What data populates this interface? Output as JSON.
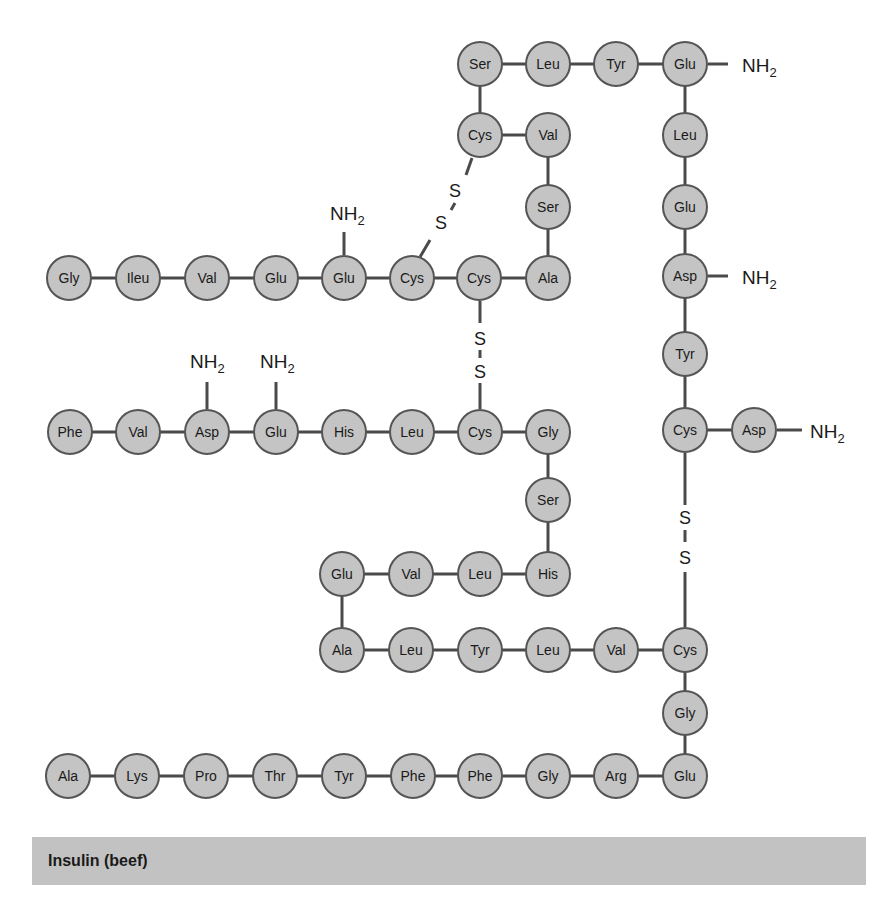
{
  "diagram": {
    "title": "Insulin (beef)",
    "style": {
      "circle_fill": "#c4c4c4",
      "circle_stroke": "#555555",
      "bond_color": "#4a4a4a",
      "text_color": "#1a1a1a",
      "caption_bg": "#c2c2c2"
    },
    "residues": [
      {
        "id": "b1",
        "label": "Ser",
        "x": 480,
        "y": 64
      },
      {
        "id": "b2",
        "label": "Leu",
        "x": 548,
        "y": 64
      },
      {
        "id": "b3",
        "label": "Tyr",
        "x": 616,
        "y": 64
      },
      {
        "id": "b4",
        "label": "Glu",
        "x": 685,
        "y": 64
      },
      {
        "id": "b5",
        "label": "Cys",
        "x": 480,
        "y": 135
      },
      {
        "id": "b6",
        "label": "Val",
        "x": 548,
        "y": 135
      },
      {
        "id": "b7",
        "label": "Leu",
        "x": 685,
        "y": 135
      },
      {
        "id": "b8",
        "label": "Ser",
        "x": 548,
        "y": 207
      },
      {
        "id": "b9",
        "label": "Glu",
        "x": 685,
        "y": 207
      },
      {
        "id": "a1",
        "label": "Gly",
        "x": 69,
        "y": 278
      },
      {
        "id": "a2",
        "label": "Ileu",
        "x": 138,
        "y": 278
      },
      {
        "id": "a3",
        "label": "Val",
        "x": 207,
        "y": 278
      },
      {
        "id": "a4",
        "label": "Glu",
        "x": 276,
        "y": 278
      },
      {
        "id": "a5",
        "label": "Glu",
        "x": 344,
        "y": 278
      },
      {
        "id": "a6",
        "label": "Cys",
        "x": 412,
        "y": 278
      },
      {
        "id": "a7",
        "label": "Cys",
        "x": 479,
        "y": 278
      },
      {
        "id": "a8",
        "label": "Ala",
        "x": 548,
        "y": 278
      },
      {
        "id": "b10",
        "label": "Asp",
        "x": 685,
        "y": 276
      },
      {
        "id": "b11",
        "label": "Tyr",
        "x": 685,
        "y": 354
      },
      {
        "id": "c1",
        "label": "Phe",
        "x": 70,
        "y": 432
      },
      {
        "id": "c2",
        "label": "Val",
        "x": 138,
        "y": 432
      },
      {
        "id": "c3",
        "label": "Asp",
        "x": 207,
        "y": 432
      },
      {
        "id": "c4",
        "label": "Glu",
        "x": 276,
        "y": 432
      },
      {
        "id": "c5",
        "label": "His",
        "x": 344,
        "y": 432
      },
      {
        "id": "c6",
        "label": "Leu",
        "x": 412,
        "y": 432
      },
      {
        "id": "c7",
        "label": "Cys",
        "x": 480,
        "y": 432
      },
      {
        "id": "c8",
        "label": "Gly",
        "x": 548,
        "y": 432
      },
      {
        "id": "b12",
        "label": "Cys",
        "x": 685,
        "y": 430
      },
      {
        "id": "b13",
        "label": "Asp",
        "x": 754,
        "y": 430
      },
      {
        "id": "c9",
        "label": "Ser",
        "x": 548,
        "y": 500
      },
      {
        "id": "c10",
        "label": "His",
        "x": 548,
        "y": 574
      },
      {
        "id": "c11",
        "label": "Leu",
        "x": 480,
        "y": 574
      },
      {
        "id": "c12",
        "label": "Val",
        "x": 411,
        "y": 574
      },
      {
        "id": "c13",
        "label": "Glu",
        "x": 342,
        "y": 574
      },
      {
        "id": "c14",
        "label": "Ala",
        "x": 342,
        "y": 650
      },
      {
        "id": "c15",
        "label": "Leu",
        "x": 411,
        "y": 650
      },
      {
        "id": "c16",
        "label": "Tyr",
        "x": 480,
        "y": 650
      },
      {
        "id": "c17",
        "label": "Leu",
        "x": 548,
        "y": 650
      },
      {
        "id": "c18",
        "label": "Val",
        "x": 616,
        "y": 650
      },
      {
        "id": "c19",
        "label": "Cys",
        "x": 685,
        "y": 650
      },
      {
        "id": "c20",
        "label": "Gly",
        "x": 685,
        "y": 713
      },
      {
        "id": "c30",
        "label": "Ala",
        "x": 68,
        "y": 776
      },
      {
        "id": "c29",
        "label": "Lys",
        "x": 137,
        "y": 776
      },
      {
        "id": "c28",
        "label": "Pro",
        "x": 206,
        "y": 776
      },
      {
        "id": "c27",
        "label": "Thr",
        "x": 275,
        "y": 776
      },
      {
        "id": "c26",
        "label": "Tyr",
        "x": 344,
        "y": 776
      },
      {
        "id": "c25",
        "label": "Phe",
        "x": 413,
        "y": 776
      },
      {
        "id": "c24",
        "label": "Phe",
        "x": 480,
        "y": 776
      },
      {
        "id": "c23",
        "label": "Gly",
        "x": 548,
        "y": 776
      },
      {
        "id": "c22",
        "label": "Arg",
        "x": 616,
        "y": 776
      },
      {
        "id": "c21",
        "label": "Glu",
        "x": 685,
        "y": 776
      }
    ],
    "bonds": [
      [
        "b1",
        "b2"
      ],
      [
        "b2",
        "b3"
      ],
      [
        "b3",
        "b4"
      ],
      [
        "b1",
        "b5"
      ],
      [
        "b5",
        "b6"
      ],
      [
        "b6",
        "b8"
      ],
      [
        "b8",
        "a8"
      ],
      [
        "b4",
        "b7"
      ],
      [
        "b7",
        "b9"
      ],
      [
        "b9",
        "b10"
      ],
      [
        "b10",
        "b11"
      ],
      [
        "b11",
        "b12"
      ],
      [
        "b12",
        "b13"
      ],
      [
        "a1",
        "a2"
      ],
      [
        "a2",
        "a3"
      ],
      [
        "a3",
        "a4"
      ],
      [
        "a4",
        "a5"
      ],
      [
        "a5",
        "a6"
      ],
      [
        "a6",
        "a7"
      ],
      [
        "a7",
        "a8"
      ],
      [
        "c1",
        "c2"
      ],
      [
        "c2",
        "c3"
      ],
      [
        "c3",
        "c4"
      ],
      [
        "c4",
        "c5"
      ],
      [
        "c5",
        "c6"
      ],
      [
        "c6",
        "c7"
      ],
      [
        "c7",
        "c8"
      ],
      [
        "c8",
        "c9"
      ],
      [
        "c9",
        "c10"
      ],
      [
        "c10",
        "c11"
      ],
      [
        "c11",
        "c12"
      ],
      [
        "c12",
        "c13"
      ],
      [
        "c13",
        "c14"
      ],
      [
        "c14",
        "c15"
      ],
      [
        "c15",
        "c16"
      ],
      [
        "c16",
        "c17"
      ],
      [
        "c17",
        "c18"
      ],
      [
        "c18",
        "c19"
      ],
      [
        "c19",
        "c20"
      ],
      [
        "c20",
        "c21"
      ],
      [
        "c21",
        "c22"
      ],
      [
        "c22",
        "c23"
      ],
      [
        "c23",
        "c24"
      ],
      [
        "c24",
        "c25"
      ],
      [
        "c25",
        "c26"
      ],
      [
        "c26",
        "c27"
      ],
      [
        "c27",
        "c28"
      ],
      [
        "c28",
        "c29"
      ],
      [
        "c29",
        "c30"
      ]
    ],
    "amide_groups": [
      {
        "label": "NH",
        "sub": "2",
        "line": [
          708,
          64,
          728,
          64
        ],
        "x": 742,
        "y": 72
      },
      {
        "label": "NH",
        "sub": "2",
        "line": [
          344,
          255,
          344,
          232
        ],
        "x": 330,
        "y": 220
      },
      {
        "label": "NH",
        "sub": "2",
        "line": [
          708,
          276,
          728,
          276
        ],
        "x": 742,
        "y": 284
      },
      {
        "label": "NH",
        "sub": "2",
        "line": [
          207,
          409,
          207,
          382
        ],
        "x": 190,
        "y": 368
      },
      {
        "label": "NH",
        "sub": "2",
        "line": [
          276,
          409,
          276,
          382
        ],
        "x": 260,
        "y": 368
      },
      {
        "label": "NH",
        "sub": "2",
        "line": [
          777,
          430,
          802,
          430
        ],
        "x": 810,
        "y": 438
      }
    ],
    "disulfide_bridges": [
      {
        "segments": [
          [
            420,
            257,
            430,
            240
          ],
          [
            455,
            203,
            451,
            210
          ],
          [
            466,
            175,
            472,
            158
          ]
        ],
        "s_labels": [
          {
            "text": "S",
            "x": 455,
            "y": 197
          },
          {
            "text": "S",
            "x": 441,
            "y": 229
          }
        ]
      },
      {
        "segments": [
          [
            480,
            301,
            480,
            323
          ],
          [
            480,
            350,
            480,
            358
          ],
          [
            480,
            383,
            480,
            409
          ]
        ],
        "s_labels": [
          {
            "text": "S",
            "x": 480,
            "y": 345
          },
          {
            "text": "S",
            "x": 480,
            "y": 378
          }
        ]
      },
      {
        "segments": [
          [
            685,
            453,
            685,
            505
          ],
          [
            685,
            530,
            685,
            542
          ],
          [
            685,
            572,
            685,
            627
          ]
        ],
        "s_labels": [
          {
            "text": "S",
            "x": 685,
            "y": 524
          },
          {
            "text": "S",
            "x": 685,
            "y": 564
          }
        ]
      }
    ]
  }
}
